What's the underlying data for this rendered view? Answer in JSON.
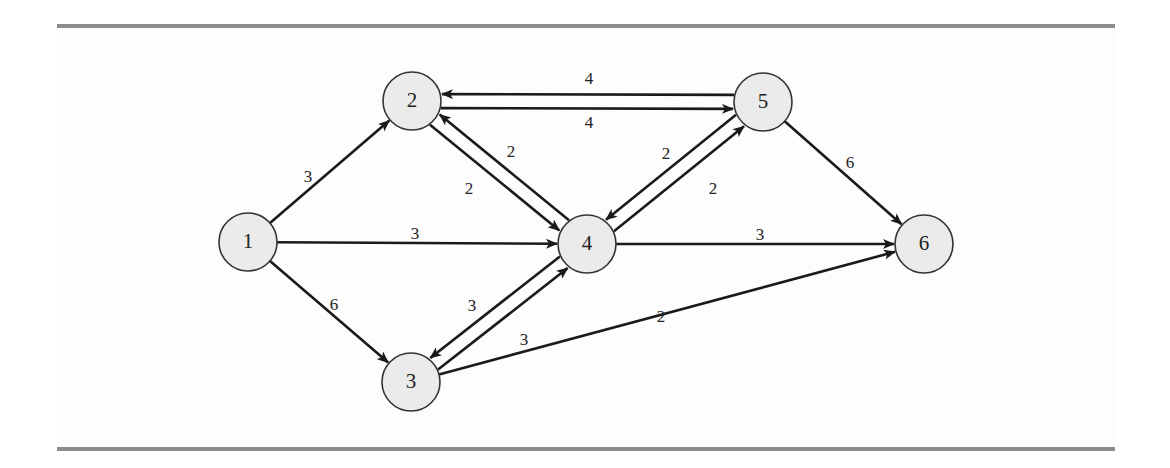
{
  "figure": {
    "type": "directed-weighted-network",
    "colors": {
      "rule": "#8c8c8c",
      "background": "#fdfdfd",
      "node_fill": "#ebebeb",
      "node_stroke": "#333333",
      "edge": "#1a1a1a",
      "text": "#222222"
    },
    "node_radius": 29,
    "nodes": [
      {
        "id": "1",
        "label": "1",
        "x": 248,
        "y": 242
      },
      {
        "id": "2",
        "label": "2",
        "x": 412,
        "y": 101
      },
      {
        "id": "3",
        "label": "3",
        "x": 411,
        "y": 382
      },
      {
        "id": "4",
        "label": "4",
        "x": 587,
        "y": 244
      },
      {
        "id": "5",
        "label": "5",
        "x": 763,
        "y": 102
      },
      {
        "id": "6",
        "label": "6",
        "x": 924,
        "y": 244
      }
    ],
    "edges": [
      {
        "from": "1",
        "to": "2",
        "weight": "3",
        "label_x": 308,
        "label_y": 178,
        "offset": 0
      },
      {
        "from": "1",
        "to": "4",
        "weight": "3",
        "label_x": 415,
        "label_y": 235,
        "offset": 0
      },
      {
        "from": "1",
        "to": "3",
        "weight": "6",
        "label_x": 334,
        "label_y": 306,
        "offset": 0
      },
      {
        "from": "2",
        "to": "5",
        "weight": "4",
        "label_x": 589,
        "label_y": 80,
        "offset": -7
      },
      {
        "from": "5",
        "to": "2",
        "weight": "4",
        "label_x": 589,
        "label_y": 124,
        "offset": -7
      },
      {
        "from": "2",
        "to": "4",
        "weight": "2",
        "label_x": 469,
        "label_y": 190,
        "offset": -7
      },
      {
        "from": "4",
        "to": "2",
        "weight": "2",
        "label_x": 511,
        "label_y": 153,
        "offset": -7
      },
      {
        "from": "5",
        "to": "4",
        "weight": "2",
        "label_x": 666,
        "label_y": 155,
        "offset": -7
      },
      {
        "from": "4",
        "to": "5",
        "weight": "2",
        "label_x": 713,
        "label_y": 190,
        "offset": -7
      },
      {
        "from": "5",
        "to": "6",
        "weight": "6",
        "label_x": 850,
        "label_y": 164,
        "offset": 0
      },
      {
        "from": "4",
        "to": "6",
        "weight": "3",
        "label_x": 760,
        "label_y": 236,
        "offset": 0
      },
      {
        "from": "4",
        "to": "3",
        "weight": "3",
        "label_x": 472,
        "label_y": 307,
        "offset": -7
      },
      {
        "from": "3",
        "to": "4",
        "weight": "3",
        "label_x": 524,
        "label_y": 341,
        "offset": -7
      },
      {
        "from": "3",
        "to": "6",
        "weight": "2",
        "label_x": 661,
        "label_y": 318,
        "offset": 0
      }
    ]
  }
}
